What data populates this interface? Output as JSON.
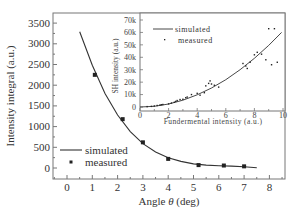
{
  "chart_data": [
    {
      "type": "line",
      "title": "",
      "xlabel": "Angle θ (deg)",
      "ylabel": "Intensity integral (a.u.)",
      "xlim": [
        -0.8,
        8.6
      ],
      "ylim": [
        -260,
        3750
      ],
      "xticks": [
        0,
        1,
        2,
        3,
        4,
        5,
        6,
        7,
        8
      ],
      "yticks": [
        0,
        500,
        1000,
        1500,
        2000,
        2500,
        3000,
        3500
      ],
      "grid": false,
      "legend_position": "lower left",
      "series": [
        {
          "name": "simulated",
          "style": "line",
          "x": [
            0.5,
            1.0,
            1.5,
            2.0,
            2.5,
            3.0,
            3.5,
            4.0,
            4.5,
            5.0,
            5.5,
            6.0,
            6.5,
            7.0,
            7.5
          ],
          "values": [
            3290,
            2480,
            1800,
            1280,
            880,
            590,
            390,
            250,
            160,
            100,
            70,
            55,
            45,
            30,
            5
          ]
        },
        {
          "name": "measured",
          "style": "square-marker",
          "x": [
            1.1,
            2.2,
            3.0,
            4.0,
            5.2,
            6.2,
            7.0
          ],
          "values": [
            2250,
            1180,
            620,
            220,
            70,
            60,
            40
          ]
        }
      ]
    },
    {
      "type": "scatter",
      "title": "",
      "role": "inset",
      "xlabel": "Fundermental intensity (a.u.)",
      "ylabel": "SH intensity (a.u.)",
      "xlim": [
        0,
        10.2
      ],
      "ylim": [
        0,
        72000
      ],
      "xticks": [
        0,
        2,
        4,
        6,
        8,
        10
      ],
      "yticks": [
        "0",
        "10k",
        "20k",
        "30k",
        "40k",
        "50k",
        "60k",
        "70k"
      ],
      "grid": false,
      "legend_position": "upper left",
      "series": [
        {
          "name": "simulated",
          "style": "line",
          "x": [
            0,
            1,
            2,
            3,
            4,
            5,
            6,
            7,
            8,
            9,
            9.9
          ],
          "values": [
            0,
            600,
            2400,
            5500,
            9800,
            15300,
            22000,
            30000,
            39200,
            49600,
            60000
          ]
        },
        {
          "name": "measured",
          "style": "dot-marker",
          "x": [
            0.5,
            0.8,
            1.0,
            1.2,
            1.4,
            1.5,
            1.6,
            2.0,
            2.2,
            2.4,
            2.5,
            2.6,
            2.8,
            3.0,
            3.2,
            3.3,
            3.6,
            4.0,
            4.2,
            4.5,
            4.6,
            4.8,
            4.9,
            5.0,
            5.2,
            5.5,
            7.2,
            7.4,
            7.5,
            7.7,
            8.0,
            8.2,
            8.5,
            8.8,
            9.0,
            9.2,
            9.4,
            9.6
          ],
          "values": [
            300,
            500,
            800,
            1200,
            1600,
            1800,
            2000,
            2500,
            3200,
            3800,
            4500,
            5200,
            6000,
            6200,
            7500,
            8000,
            10000,
            11000,
            9500,
            11500,
            17000,
            19000,
            21000,
            18500,
            17500,
            16000,
            35000,
            33000,
            31000,
            36000,
            42000,
            44000,
            42500,
            38000,
            63000,
            34000,
            63000,
            36000
          ]
        }
      ]
    }
  ],
  "main": {
    "ylabel": "Intensity integral (a.u.)",
    "xlabel_prefix": "Angle ",
    "xlabel_symbol": "θ",
    "xlabel_suffix": " (deg)",
    "xtick_labels": [
      "0",
      "1",
      "2",
      "3",
      "4",
      "5",
      "6",
      "7",
      "8"
    ],
    "ytick_labels": [
      "0",
      "500",
      "1000",
      "1500",
      "2000",
      "2500",
      "3000",
      "3500"
    ],
    "legend": {
      "simulated": "simulated",
      "measured": "measured"
    }
  },
  "inset": {
    "ylabel": "SH intensity (a.u.)",
    "xlabel": "Fundermental intensity (a.u.)",
    "xtick_labels": [
      "0",
      "2",
      "4",
      "6",
      "8",
      "10"
    ],
    "ytick_labels": [
      "0",
      "10k",
      "20k",
      "30k",
      "40k",
      "50k",
      "60k",
      "70k"
    ],
    "legend": {
      "simulated": "simulated",
      "measured": "measured"
    }
  },
  "colors": {
    "axis": "#666666",
    "line": "#333333",
    "marker": "#222222",
    "text": "#333333"
  }
}
